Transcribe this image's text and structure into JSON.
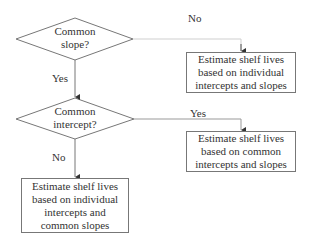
{
  "diagram": {
    "type": "flowchart",
    "nodes": [
      {
        "id": "d1",
        "shape": "diamond",
        "lines": [
          "Common",
          "slope?"
        ]
      },
      {
        "id": "d2",
        "shape": "diamond",
        "lines": [
          "Common",
          "intercept?"
        ]
      },
      {
        "id": "b1",
        "shape": "box",
        "lines": [
          "Estimate shelf lives",
          "based on individual",
          "intercepts and slopes"
        ]
      },
      {
        "id": "b2",
        "shape": "box",
        "lines": [
          "Estimate shelf lives",
          "based on common",
          "intercepts and slopes"
        ]
      },
      {
        "id": "b3",
        "shape": "box",
        "lines": [
          "Estimate shelf lives",
          "based on individual",
          "intercepts and",
          "common slopes"
        ]
      }
    ],
    "edges": [
      {
        "from": "d1",
        "to": "b1",
        "label": "No"
      },
      {
        "from": "d1",
        "to": "d2",
        "label": "Yes"
      },
      {
        "from": "d2",
        "to": "b2",
        "label": "Yes"
      },
      {
        "from": "d2",
        "to": "b3",
        "label": "No"
      }
    ],
    "colors": {
      "stroke": "#777777",
      "faint_stroke": "#cfcfcf",
      "text": "#333333",
      "background": "#ffffff"
    }
  }
}
